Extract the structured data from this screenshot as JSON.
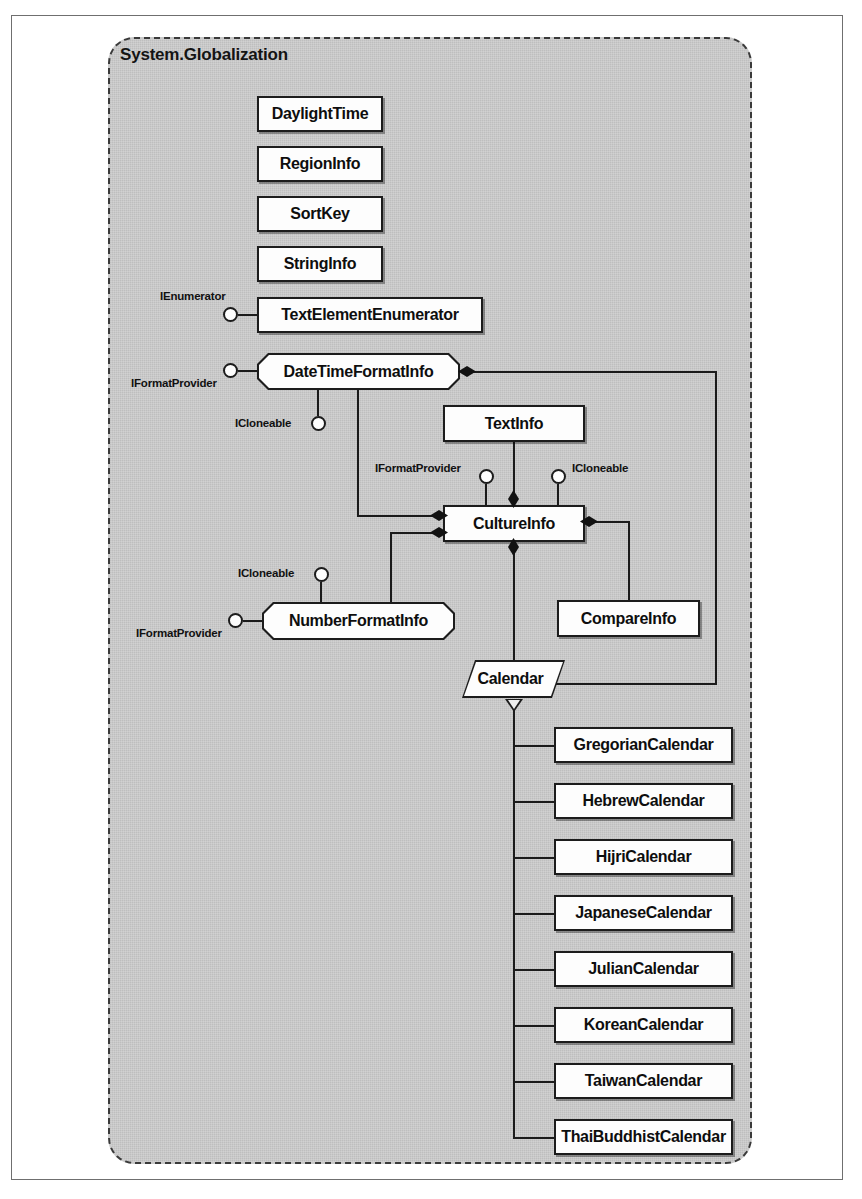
{
  "package": {
    "name": "System.Globalization",
    "style": "dashed-rounded-rectangle",
    "fill_color": "#c9c9c9",
    "border_color": "#3a3a3a"
  },
  "diagram": {
    "type": "uml-class-diagram",
    "notation": {
      "rectangle": "class",
      "octagon": "class implementing interfaces",
      "parallelogram": "abstract class",
      "lollipop": "provided interface",
      "filled-diamond": "composition",
      "hollow-triangle": "inheritance"
    }
  },
  "classes": [
    {
      "id": "DaylightTime",
      "label": "DaylightTime",
      "shape": "rect",
      "x": 257,
      "y": 96,
      "w": 126,
      "h": 36
    },
    {
      "id": "RegionInfo",
      "label": "RegionInfo",
      "shape": "rect",
      "x": 257,
      "y": 146,
      "w": 126,
      "h": 36
    },
    {
      "id": "SortKey",
      "label": "SortKey",
      "shape": "rect",
      "x": 257,
      "y": 196,
      "w": 126,
      "h": 36
    },
    {
      "id": "StringInfo",
      "label": "StringInfo",
      "shape": "rect",
      "x": 257,
      "y": 246,
      "w": 126,
      "h": 36
    },
    {
      "id": "TextElementEnumerator",
      "label": "TextElementEnumerator",
      "shape": "rect",
      "x": 257,
      "y": 297,
      "w": 226,
      "h": 36
    },
    {
      "id": "DateTimeFormatInfo",
      "label": "DateTimeFormatInfo",
      "shape": "oct",
      "x": 257,
      "y": 353,
      "w": 203,
      "h": 37
    },
    {
      "id": "TextInfo",
      "label": "TextInfo",
      "shape": "rect",
      "x": 443,
      "y": 405,
      "w": 142,
      "h": 37
    },
    {
      "id": "CultureInfo",
      "label": "CultureInfo",
      "shape": "rect",
      "x": 443,
      "y": 505,
      "w": 142,
      "h": 37
    },
    {
      "id": "NumberFormatInfo",
      "label": "NumberFormatInfo",
      "shape": "oct",
      "x": 262,
      "y": 602,
      "w": 193,
      "h": 38
    },
    {
      "id": "CompareInfo",
      "label": "CompareInfo",
      "shape": "rect",
      "x": 557,
      "y": 600,
      "w": 143,
      "h": 37
    },
    {
      "id": "Calendar",
      "label": "Calendar",
      "shape": "para",
      "x": 462,
      "y": 660,
      "w": 103,
      "h": 38
    },
    {
      "id": "GregorianCalendar",
      "label": "GregorianCalendar",
      "shape": "rect",
      "x": 554,
      "y": 727,
      "w": 179,
      "h": 36
    },
    {
      "id": "HebrewCalendar",
      "label": "HebrewCalendar",
      "shape": "rect",
      "x": 554,
      "y": 783,
      "w": 179,
      "h": 36
    },
    {
      "id": "HijriCalendar",
      "label": "HijriCalendar",
      "shape": "rect",
      "x": 554,
      "y": 839,
      "w": 179,
      "h": 36
    },
    {
      "id": "JapaneseCalendar",
      "label": "JapaneseCalendar",
      "shape": "rect",
      "x": 554,
      "y": 895,
      "w": 179,
      "h": 36
    },
    {
      "id": "JulianCalendar",
      "label": "JulianCalendar",
      "shape": "rect",
      "x": 554,
      "y": 951,
      "w": 179,
      "h": 36
    },
    {
      "id": "KoreanCalendar",
      "label": "KoreanCalendar",
      "shape": "rect",
      "x": 554,
      "y": 1007,
      "w": 179,
      "h": 36
    },
    {
      "id": "TaiwanCalendar",
      "label": "TaiwanCalendar",
      "shape": "rect",
      "x": 554,
      "y": 1063,
      "w": 179,
      "h": 36
    },
    {
      "id": "ThaiBuddhistCalendar",
      "label": "ThaiBuddhistCalendar",
      "shape": "rect",
      "x": 554,
      "y": 1119,
      "w": 179,
      "h": 36
    }
  ],
  "interfaces": [
    {
      "id": "if-tee-ienumerator",
      "label": "IEnumerator",
      "owner": "TextElementEnumerator",
      "side": "left"
    },
    {
      "id": "if-dtfi-iformat",
      "label": "IFormatProvider",
      "owner": "DateTimeFormatInfo",
      "side": "left"
    },
    {
      "id": "if-dtfi-icloneable",
      "label": "ICloneable",
      "owner": "DateTimeFormatInfo",
      "side": "bottom"
    },
    {
      "id": "if-ci-iformat",
      "label": "IFormatProvider",
      "owner": "CultureInfo",
      "side": "top-left"
    },
    {
      "id": "if-ci-icloneable",
      "label": "ICloneable",
      "owner": "CultureInfo",
      "side": "top-right"
    },
    {
      "id": "if-nfi-icloneable",
      "label": "ICloneable",
      "owner": "NumberFormatInfo",
      "side": "top"
    },
    {
      "id": "if-nfi-iformat",
      "label": "IFormatProvider",
      "owner": "NumberFormatInfo",
      "side": "left"
    }
  ],
  "relationships": [
    {
      "type": "composition",
      "from": "CultureInfo",
      "to": "TextInfo"
    },
    {
      "type": "composition",
      "from": "CultureInfo",
      "to": "DateTimeFormatInfo"
    },
    {
      "type": "composition",
      "from": "CultureInfo",
      "to": "NumberFormatInfo"
    },
    {
      "type": "composition",
      "from": "CultureInfo",
      "to": "CompareInfo"
    },
    {
      "type": "composition",
      "from": "CultureInfo",
      "to": "Calendar"
    },
    {
      "type": "composition",
      "from": "Calendar",
      "to": "DateTimeFormatInfo"
    },
    {
      "type": "inheritance",
      "parent": "Calendar",
      "children": [
        "GregorianCalendar",
        "HebrewCalendar",
        "HijriCalendar",
        "JapaneseCalendar",
        "JulianCalendar",
        "KoreanCalendar",
        "TaiwanCalendar",
        "ThaiBuddhistCalendar"
      ]
    }
  ]
}
